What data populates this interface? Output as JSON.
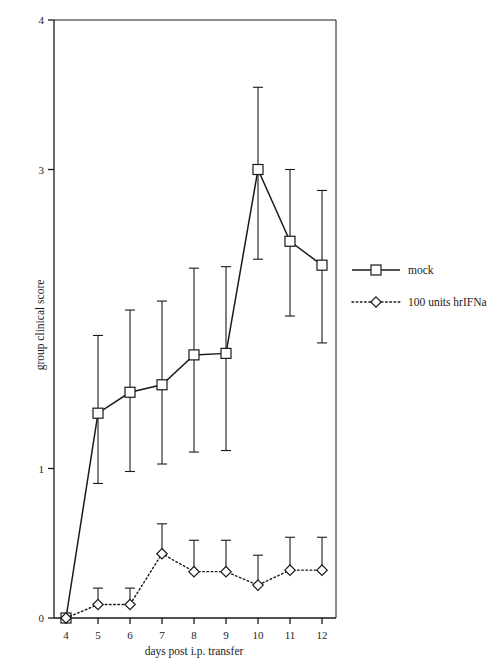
{
  "chart_data": {
    "type": "line",
    "title": "",
    "subtitle": "",
    "xlabel": "days post i.p. transfer",
    "ylabel": "group clinical score",
    "x": [
      4,
      5,
      6,
      7,
      8,
      9,
      10,
      11,
      12
    ],
    "xticklabels": [
      "4",
      "5",
      "6",
      "7",
      "8",
      "9",
      "10",
      "11",
      "12"
    ],
    "yticklabels": [
      "0",
      "1",
      "3",
      "4"
    ],
    "ytickvalues": [
      0,
      1,
      3,
      4
    ],
    "xlim": [
      3.6,
      12.5
    ],
    "ylim": [
      0,
      4
    ],
    "grid": false,
    "legend_position": "right",
    "errorbars": true,
    "series": [
      {
        "name": "mock",
        "marker": "square",
        "linestyle": "solid",
        "color": "#1a1a1a",
        "values": [
          0.0,
          1.37,
          1.51,
          1.56,
          1.76,
          1.77,
          3.0,
          2.52,
          2.36
        ],
        "err_upper": [
          0.0,
          0.52,
          0.55,
          0.56,
          0.58,
          0.58,
          0.55,
          0.48,
          0.5
        ],
        "err_lower": [
          0.0,
          0.47,
          0.53,
          0.53,
          0.65,
          0.65,
          0.6,
          0.5,
          0.52
        ]
      },
      {
        "name": "100 units hrIFNa",
        "marker": "diamond",
        "linestyle": "dotted",
        "color": "#1a1a1a",
        "values": [
          0.0,
          0.09,
          0.09,
          0.43,
          0.31,
          0.31,
          0.22,
          0.32,
          0.32
        ],
        "err_upper": [
          0.0,
          0.11,
          0.11,
          0.2,
          0.21,
          0.21,
          0.2,
          0.22,
          0.22
        ],
        "err_lower": [
          0.0,
          0.0,
          0.0,
          0.0,
          0.0,
          0.0,
          0.0,
          0.0,
          0.0
        ]
      }
    ]
  },
  "legend": {
    "items": [
      {
        "label": "mock",
        "marker": "square",
        "linestyle": "solid"
      },
      {
        "label": "100 units hrIFNa",
        "marker": "diamond",
        "linestyle": "dotted"
      }
    ]
  }
}
